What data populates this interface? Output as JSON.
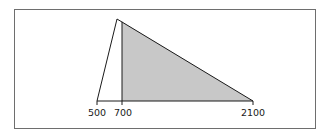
{
  "diagram": {
    "type": "triangular-distribution",
    "axis_labels": [
      {
        "value": "500",
        "x": 97
      },
      {
        "value": "700",
        "x": 122
      },
      {
        "value": "2100",
        "x": 253
      }
    ],
    "apex": {
      "x": 117,
      "y": 19
    },
    "baseline_y": 101,
    "shaded_region": {
      "from": "700",
      "to": "2100"
    },
    "colors": {
      "line": "#1a1a1a",
      "fill": "#c8c8c8",
      "frame": "#6e6e6e"
    }
  }
}
